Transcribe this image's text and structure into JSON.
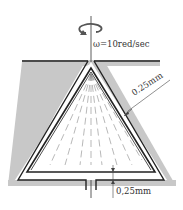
{
  "diagram": {
    "type": "rotating cone viscometer cross-section",
    "rotation_label": "ω=10red/sec",
    "gap_side_label": "0.25mm",
    "gap_bottom_label": "0,25mm",
    "colors": {
      "housing": "#c8c8c8",
      "outline": "#222222",
      "background": "#ffffff",
      "text": "#333333"
    }
  }
}
